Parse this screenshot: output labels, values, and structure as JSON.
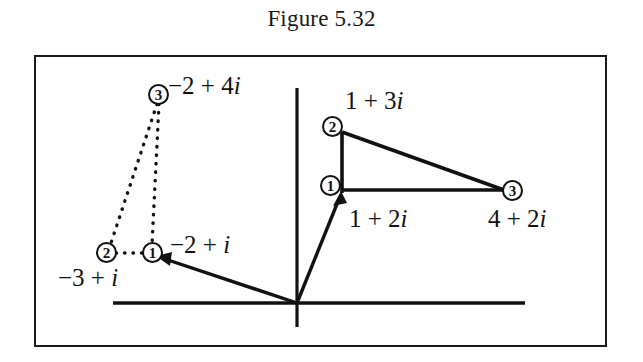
{
  "figure": {
    "title": "Figure 5.32",
    "domain": "complex-plane-vector-diagram",
    "background_color": "#ffffff",
    "ink_color": "#111111"
  },
  "axes": {
    "origin_label": "",
    "real_axis_name": "real-axis",
    "imaginary_axis_name": "imaginary-axis"
  },
  "right_figure": {
    "name": "solid-right-triangle",
    "nodes": [
      {
        "badge": "1",
        "label": "1 + 2i"
      },
      {
        "badge": "2",
        "label": "1 + 3i"
      },
      {
        "badge": "3",
        "label": "4 + 2i"
      }
    ]
  },
  "left_figure": {
    "name": "dotted-translated-triangle",
    "nodes": [
      {
        "badge": "1",
        "label": "-2 + i"
      },
      {
        "badge": "2",
        "label": "-3 + i"
      },
      {
        "badge": "3",
        "label": "-2 + 4i"
      }
    ]
  },
  "labels": {
    "one_plus_two_i": "1 + 2i",
    "one_plus_three_i": "1 + 3i",
    "four_plus_two_i": "4 + 2i",
    "minus_two_plus_i": "−2 + i",
    "minus_three_plus_i": "−3 + i",
    "minus_two_plus_four_i": "−2 + 4i"
  },
  "badges": {
    "n1": "1",
    "n2": "2",
    "n3": "3"
  },
  "chart_data": {
    "type": "scatter",
    "title": "Figure 5.32",
    "xlabel": "",
    "ylabel": "",
    "grid": false,
    "legend": "none",
    "series": [
      {
        "name": "solid-right-triangle",
        "style": "solid",
        "points": [
          {
            "vertex": "1",
            "label": "1 + 2i",
            "re": 1,
            "im": 2
          },
          {
            "vertex": "2",
            "label": "1 + 3i",
            "re": 1,
            "im": 3
          },
          {
            "vertex": "3",
            "label": "4 + 2i",
            "re": 4,
            "im": 2
          }
        ],
        "edges": [
          [
            "1",
            "2"
          ],
          [
            "2",
            "3"
          ],
          [
            "3",
            "1"
          ]
        ]
      },
      {
        "name": "dotted-translated-triangle",
        "style": "dotted",
        "points": [
          {
            "vertex": "1",
            "label": "−2 + i",
            "re": -2,
            "im": 1
          },
          {
            "vertex": "2",
            "label": "−3 + i",
            "re": -3,
            "im": 1
          },
          {
            "vertex": "3",
            "label": "−2 + 4i",
            "re": -2,
            "im": 4
          }
        ],
        "edges": [
          [
            "1",
            "2"
          ],
          [
            "2",
            "3"
          ],
          [
            "3",
            "1"
          ]
        ]
      }
    ],
    "vectors": [
      {
        "name": "origin-to-solid-vertex-1",
        "from": [
          0,
          0
        ],
        "to": [
          1,
          2
        ],
        "arrow": true
      },
      {
        "name": "origin-to-dotted-vertex-1",
        "from": [
          0,
          0
        ],
        "to": [
          -2,
          1
        ],
        "arrow": true
      }
    ]
  }
}
